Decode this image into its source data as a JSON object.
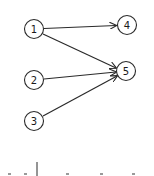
{
  "diagram": {
    "type": "directed-graph",
    "nodes": [
      {
        "id": "1",
        "label": "1",
        "x": 34,
        "y": 29
      },
      {
        "id": "2",
        "label": "2",
        "x": 34,
        "y": 80
      },
      {
        "id": "3",
        "label": "3",
        "x": 34,
        "y": 121
      },
      {
        "id": "4",
        "label": "4",
        "x": 127,
        "y": 25
      },
      {
        "id": "5",
        "label": "5",
        "x": 126,
        "y": 71
      }
    ],
    "edges": [
      {
        "from": "1",
        "to": "4"
      },
      {
        "from": "1",
        "to": "5"
      },
      {
        "from": "2",
        "to": "5"
      },
      {
        "from": "3",
        "to": "5"
      }
    ],
    "colors": {
      "stroke": "#2a2a2a",
      "background": "#ffffff"
    }
  }
}
